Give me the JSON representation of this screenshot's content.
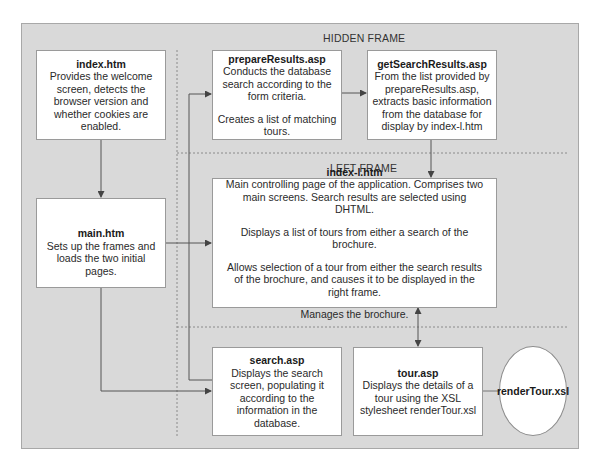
{
  "frames": {
    "hidden": "HIDDEN FRAME",
    "left": "LEFT FRAME"
  },
  "nodes": {
    "index_htm": {
      "title": "index.htm",
      "lines": [
        "Provides the welcome screen, detects the browser version and whether cookies are enabled."
      ]
    },
    "main_htm": {
      "title": "main.htm",
      "lines": [
        "Sets up the frames and loads the two initial pages."
      ]
    },
    "prepare_results": {
      "title": "prepareResults.asp",
      "lines": [
        "Conducts the database search according to the form criteria.",
        "Creates a list of matching tours."
      ]
    },
    "get_search_results": {
      "title": "getSearchResults.asp",
      "lines": [
        "From the list provided by prepareResults.asp, extracts basic information from the database for display by index-l.htm"
      ]
    },
    "index_l_htm": {
      "title": "index-l.htm",
      "lines": [
        "Main controlling page of the application. Comprises two main screens. Search results are selected using DHTML.",
        "Displays a list of tours from either a search of the brochure.",
        "Allows selection of a tour from either the search results of the brochure, and causes it to be displayed in the right frame.",
        "Manages the brochure."
      ]
    },
    "search_asp": {
      "title": "search.asp",
      "lines": [
        "Displays the search screen, populating it according to the information in the database."
      ]
    },
    "tour_asp": {
      "title": "tour.asp",
      "lines": [
        "Displays the details of a tour using the XSL stylesheet renderTour.xsl"
      ]
    },
    "render_tour": {
      "title": "renderTour.xsl"
    }
  },
  "edges": [
    {
      "from": "index.htm",
      "to": "main.htm",
      "type": "arrow"
    },
    {
      "from": "main.htm",
      "to": "index-l.htm",
      "type": "arrow"
    },
    {
      "from": "main.htm",
      "to": "search.asp",
      "type": "arrow"
    },
    {
      "from": "search.asp",
      "to": "prepareResults.asp",
      "type": "arrow"
    },
    {
      "from": "prepareResults.asp",
      "to": "getSearchResults.asp",
      "type": "arrow"
    },
    {
      "from": "getSearchResults.asp",
      "to": "index-l.htm",
      "type": "arrow"
    },
    {
      "from": "index-l.htm",
      "to": "tour.asp",
      "type": "bidirectional"
    },
    {
      "from": "tour.asp",
      "to": "renderTour.xsl",
      "type": "line"
    }
  ],
  "colors": {
    "panel": "#d9d9d9",
    "box": "#ffffff",
    "line": "#555555"
  }
}
